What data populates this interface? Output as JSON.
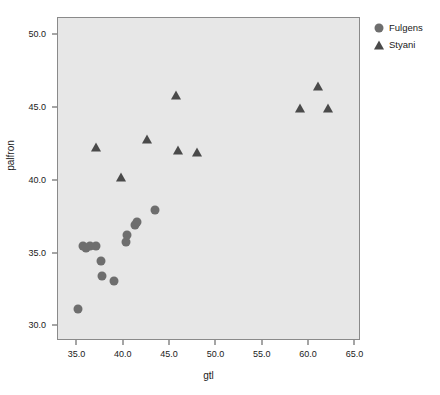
{
  "chart_data": {
    "type": "scatter",
    "title": "",
    "xlabel": "gtl",
    "ylabel": "palfron",
    "xlim": [
      32.9,
      65.6
    ],
    "ylim": [
      29.0,
      51.2
    ],
    "xticks": [
      "35.0",
      "40.0",
      "45.0",
      "50.0",
      "55.0",
      "60.0",
      "65.0"
    ],
    "xtick_values": [
      35.0,
      40.0,
      45.0,
      50.0,
      55.0,
      60.0,
      65.0
    ],
    "yticks": [
      "30.0",
      "35.0",
      "40.0",
      "45.0",
      "50.0"
    ],
    "ytick_values": [
      30.0,
      35.0,
      40.0,
      45.0,
      50.0
    ],
    "grid": false,
    "legend_position": "right-top",
    "plot_background": "#e7e7e7",
    "series": [
      {
        "name": "Fulgens",
        "marker": "circle",
        "color": "#6e6e6e",
        "points": [
          [
            35.05,
            31.2
          ],
          [
            35.6,
            35.5
          ],
          [
            35.9,
            35.4
          ],
          [
            36.3,
            35.5
          ],
          [
            37.0,
            35.5
          ],
          [
            37.5,
            34.5
          ],
          [
            37.6,
            33.5
          ],
          [
            38.9,
            33.1
          ],
          [
            40.2,
            35.8
          ],
          [
            40.3,
            36.3
          ],
          [
            41.2,
            37.0
          ],
          [
            41.4,
            37.2
          ],
          [
            43.4,
            38.0
          ]
        ]
      },
      {
        "name": "Styani",
        "marker": "triangle",
        "color": "#4a4a4a",
        "points": [
          [
            37.0,
            42.3
          ],
          [
            39.7,
            40.3
          ],
          [
            42.5,
            42.9
          ],
          [
            45.6,
            45.9
          ],
          [
            45.9,
            42.1
          ],
          [
            47.9,
            42.0
          ],
          [
            59.0,
            45.0
          ],
          [
            61.0,
            46.5
          ],
          [
            62.0,
            45.0
          ]
        ]
      }
    ]
  },
  "legend": {
    "entries": [
      {
        "label": "Fulgens",
        "marker": "circle"
      },
      {
        "label": "Styani",
        "marker": "triangle"
      }
    ]
  }
}
